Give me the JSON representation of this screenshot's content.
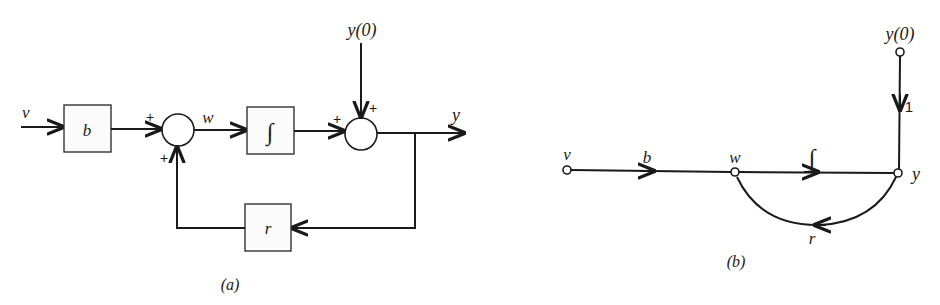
{
  "figure_a": {
    "caption": "(a)",
    "input_label": "v",
    "gain_b_label": "b",
    "integrator_label": "∫",
    "feedback_r_label": "r",
    "summer1_signs": {
      "top": "+",
      "bottom": "+"
    },
    "summer1_output_label": "w",
    "summer2_signs": {
      "left": "+",
      "top": "+"
    },
    "initial_condition_label": "y(0)",
    "output_label": "y"
  },
  "figure_b": {
    "caption": "(b)",
    "nodes": [
      "v",
      "w",
      "y",
      "y(0)"
    ],
    "branch_labels": {
      "v_to_w": "b",
      "w_to_y": "∫",
      "y_to_w": "r",
      "y0_to_y": "1"
    }
  }
}
